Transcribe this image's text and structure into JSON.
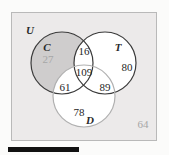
{
  "diagram": {
    "type": "venn-3-set",
    "universe_label": "U",
    "universe_outside_count": "64",
    "sets": [
      {
        "key": "C",
        "label": "C",
        "label_x": 47,
        "label_y": 47
      },
      {
        "key": "T",
        "label": "T",
        "label_x": 118,
        "label_y": 47
      },
      {
        "key": "D",
        "label": "D",
        "label_x": 90,
        "label_y": 120
      }
    ],
    "regions": [
      {
        "key": "C_only",
        "value": "27",
        "x": 48,
        "y": 59,
        "muted": true
      },
      {
        "key": "C_and_T",
        "value": "16",
        "x": 84,
        "y": 51,
        "muted": false
      },
      {
        "key": "T_only",
        "value": "80",
        "x": 127,
        "y": 67,
        "muted": false
      },
      {
        "key": "C_T_D",
        "value": "109",
        "x": 84,
        "y": 72,
        "muted": false
      },
      {
        "key": "C_and_D",
        "value": "61",
        "x": 65,
        "y": 87,
        "muted": false
      },
      {
        "key": "T_and_D",
        "value": "89",
        "x": 105,
        "y": 87,
        "muted": false
      },
      {
        "key": "D_only",
        "value": "78",
        "x": 79,
        "y": 112,
        "muted": false
      },
      {
        "key": "outside",
        "value": "64",
        "x": 143,
        "y": 124,
        "muted": true
      }
    ],
    "geometry": {
      "circle_c": {
        "cx": 62,
        "cy": 63,
        "r": 31
      },
      "circle_t": {
        "cx": 105,
        "cy": 63,
        "r": 31
      },
      "circle_d": {
        "cx": 84,
        "cy": 96,
        "r": 31
      }
    },
    "colors": {
      "frame_fill": "#eceaea",
      "frame_stroke": "#b9b9b9",
      "circle_fill": "#ffffff",
      "circle_stroke_dark": "#3a3a3a",
      "circle_stroke_light": "#b0b0b0",
      "shaded_region_fill": "#cfcdcd",
      "text": "#262626",
      "text_muted": "#a6a6a6",
      "page_bg": "#fbfbfa",
      "bar": "#111111"
    }
  }
}
